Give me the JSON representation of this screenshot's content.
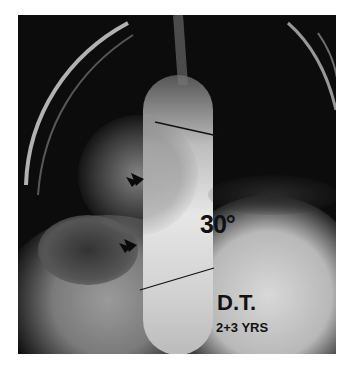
{
  "image": {
    "type": "radiograph",
    "description": "Frontal chest/spine X-ray showing scoliotic curve with two Cobb-angle reference lines and two arrows",
    "annotations": {
      "angle_label": "30°",
      "patient_label": "D.T.",
      "age_label": "2+3 YRS"
    },
    "markers": [
      {
        "type": "arrow",
        "position": "upper"
      },
      {
        "type": "arrow",
        "position": "lower"
      }
    ],
    "reference_lines": [
      {
        "name": "upper-endplate-line"
      },
      {
        "name": "lower-endplate-line"
      }
    ]
  }
}
